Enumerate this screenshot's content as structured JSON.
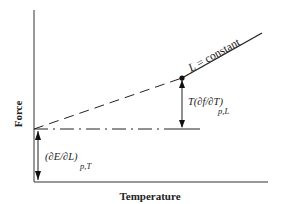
{
  "diagram": {
    "y_axis_label": "Force",
    "x_axis_label": "Temperature",
    "line_label": "L = constant",
    "line_label_var": "L",
    "line_label_rest": " = constant",
    "entropic_label_main": "T(∂f/∂T)",
    "entropic_label_sub": "p,L",
    "energetic_label_main": "(∂E/∂L)",
    "energetic_label_sub": "p,T",
    "colors": {
      "line": "#222222",
      "text": "#222222",
      "background": "#ffffff"
    }
  }
}
